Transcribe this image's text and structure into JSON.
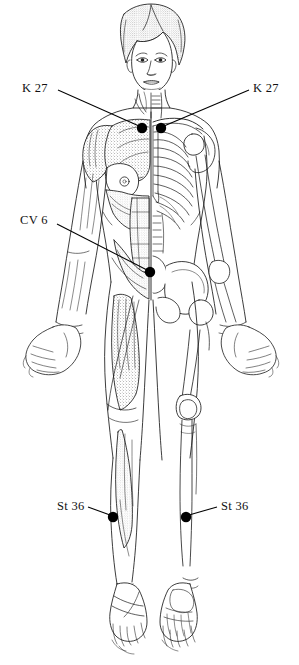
{
  "chart": {
    "view": "anterior",
    "rendering": "black and white line drawing; left half musculature with stipple shading, right half skeleton",
    "background_color": "#ffffff",
    "ink_color": "#1a1a1a",
    "marker_color": "#000000"
  },
  "points": [
    {
      "id": "k27-left",
      "label": "K 27",
      "meridian": "Kidney",
      "number": "27",
      "side": "left",
      "label_x": 22,
      "label_y": 82,
      "dot_x": 142,
      "dot_y": 128,
      "leader_x1": 58,
      "leader_y1": 90,
      "leader_x2": 139,
      "leader_y2": 126
    },
    {
      "id": "k27-right",
      "label": "K 27",
      "meridian": "Kidney",
      "number": "27",
      "side": "right",
      "label_x": 253,
      "label_y": 82,
      "dot_x": 161,
      "dot_y": 128,
      "leader_x1": 249,
      "leader_y1": 90,
      "leader_x2": 164,
      "leader_y2": 126
    },
    {
      "id": "cv6",
      "label": "CV 6",
      "meridian": "Conception Vessel",
      "number": "6",
      "side": "midline",
      "label_x": 20,
      "label_y": 214,
      "dot_x": 150,
      "dot_y": 272,
      "leader_x1": 57,
      "leader_y1": 224,
      "leader_x2": 147,
      "leader_y2": 270
    },
    {
      "id": "st36-left",
      "label": "St 36",
      "meridian": "Stomach",
      "number": "36",
      "side": "left",
      "label_x": 57,
      "label_y": 500,
      "dot_x": 113,
      "dot_y": 517,
      "leader_x1": 88,
      "leader_y1": 507,
      "leader_x2": 110,
      "leader_y2": 515
    },
    {
      "id": "st36-right",
      "label": "St 36",
      "meridian": "Stomach",
      "number": "36",
      "side": "right",
      "label_x": 221,
      "label_y": 500,
      "dot_x": 186,
      "dot_y": 517,
      "leader_x1": 217,
      "leader_y1": 507,
      "leader_x2": 189,
      "leader_y2": 515
    }
  ]
}
